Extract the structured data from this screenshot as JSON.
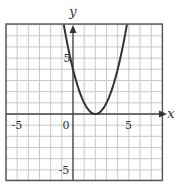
{
  "chart_data": {
    "type": "line",
    "title": "",
    "xlabel": "x",
    "ylabel": "y",
    "xlim": [
      -6,
      8
    ],
    "ylim": [
      -6,
      8
    ],
    "grid": true,
    "grid_step": 1,
    "x_tick_labels": [
      {
        "value": -5,
        "label": "-5"
      },
      {
        "value": 0,
        "label": "0"
      },
      {
        "value": 5,
        "label": "5"
      }
    ],
    "y_tick_labels": [
      {
        "value": 5,
        "label": "5"
      },
      {
        "value": -5,
        "label": "-5"
      }
    ],
    "series": [
      {
        "name": "y = (x - 2)^2",
        "equation": "y = (x - 2)^2",
        "vertex": [
          2,
          0
        ],
        "x": [
          -0.83,
          -0.5,
          0,
          0.5,
          1,
          1.5,
          2,
          2.5,
          3,
          3.5,
          4,
          4.5,
          4.83
        ],
        "values": [
          8,
          6.25,
          4,
          2.25,
          1,
          0.25,
          0,
          0.25,
          1,
          2.25,
          4,
          6.25,
          8
        ]
      }
    ]
  },
  "labels": {
    "x_axis": "x",
    "y_axis": "y",
    "x_neg5": "-5",
    "x_zero": "0",
    "x_pos5": "5",
    "y_pos5": "5",
    "y_neg5": "-5"
  },
  "colors": {
    "grid": "#c8c8c8",
    "axis": "#444444",
    "border": "#555555",
    "curve": "#333333"
  }
}
